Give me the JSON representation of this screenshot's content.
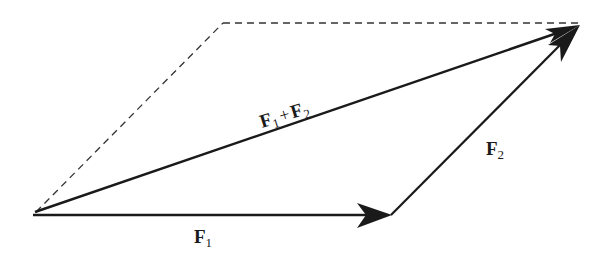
{
  "diagram": {
    "colors": {
      "line": "#1a1a1a",
      "dashed": "#333333",
      "background": "#ffffff"
    },
    "vectors": [
      {
        "id": "F1",
        "label": "F",
        "subscript": "1"
      },
      {
        "id": "F2",
        "label": "F",
        "subscript": "2"
      },
      {
        "id": "sum",
        "label_a": "F",
        "sub_a": "1",
        "plus": "+",
        "label_b": "F",
        "sub_b": "2"
      }
    ],
    "dashed_edges": [
      "top edge (parallel to F1)",
      "left edge (parallel to F2)"
    ]
  }
}
